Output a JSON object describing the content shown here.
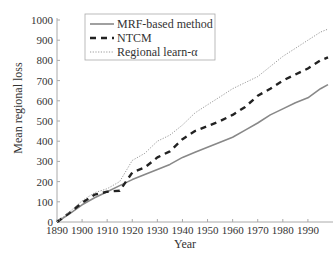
{
  "chart_data": {
    "type": "line",
    "title": "",
    "xlabel": "Year",
    "ylabel": "Mean regional loss",
    "xlim": [
      1890,
      2000
    ],
    "ylim": [
      0,
      1000
    ],
    "grid": false,
    "legend_position": "upper left",
    "x_ticks": [
      "1890",
      "1900",
      "1910",
      "1920",
      "1930",
      "1940",
      "1950",
      "1960",
      "1970",
      "1980",
      "1990"
    ],
    "y_ticks": [
      "0",
      "100",
      "200",
      "300",
      "400",
      "500",
      "600",
      "700",
      "800",
      "900",
      "1000"
    ],
    "x": [
      1890,
      1895,
      1900,
      1905,
      1910,
      1915,
      1920,
      1925,
      1930,
      1935,
      1940,
      1945,
      1950,
      1955,
      1960,
      1965,
      1970,
      1975,
      1980,
      1985,
      1990,
      1995,
      1998
    ],
    "series": [
      {
        "name": "MRF-based method",
        "style": "solid",
        "color": "#888888",
        "values": [
          0,
          40,
          85,
          120,
          150,
          180,
          210,
          235,
          260,
          285,
          320,
          345,
          370,
          395,
          420,
          455,
          490,
          530,
          560,
          590,
          615,
          660,
          680
        ]
      },
      {
        "name": "NTCM",
        "style": "dashed",
        "color": "#222222",
        "values": [
          0,
          45,
          95,
          135,
          150,
          155,
          245,
          270,
          320,
          350,
          410,
          450,
          475,
          500,
          530,
          570,
          625,
          660,
          700,
          730,
          760,
          800,
          815
        ]
      },
      {
        "name": "Regional learn-α",
        "style": "dotted",
        "color": "#999999",
        "values": [
          0,
          50,
          105,
          145,
          165,
          200,
          305,
          340,
          400,
          430,
          480,
          540,
          580,
          620,
          660,
          690,
          720,
          770,
          820,
          860,
          900,
          940,
          955
        ]
      }
    ]
  },
  "legend": {
    "items": [
      {
        "label": "MRF-based method"
      },
      {
        "label": "NTCM"
      },
      {
        "label": "Regional learn-α"
      }
    ]
  },
  "axes": {
    "xlabel": "Year",
    "ylabel": "Mean regional loss"
  }
}
